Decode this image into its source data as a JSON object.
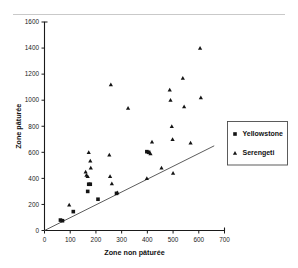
{
  "chart_data": {
    "type": "scatter",
    "title": "",
    "xlabel": "Zone non pâturée",
    "ylabel": "Zone pâturée",
    "xlim": [
      0,
      700
    ],
    "ylim": [
      0,
      1600
    ],
    "xticks": [
      0,
      100,
      200,
      300,
      400,
      500,
      600,
      700
    ],
    "yticks": [
      0,
      200,
      400,
      600,
      800,
      1000,
      1200,
      1400,
      1600
    ],
    "grid": false,
    "legend_position": "right",
    "series": [
      {
        "name": "Yellowstone",
        "marker": "square",
        "color": "#141414",
        "points": [
          [
            62,
            80
          ],
          [
            70,
            75
          ],
          [
            112,
            145
          ],
          [
            168,
            300
          ],
          [
            172,
            355
          ],
          [
            178,
            355
          ],
          [
            208,
            240
          ],
          [
            280,
            285
          ],
          [
            398,
            605
          ],
          [
            405,
            600
          ]
        ]
      },
      {
        "name": "Serengeti",
        "marker": "triangle",
        "color": "#141414",
        "points": [
          [
            96,
            197
          ],
          [
            160,
            450
          ],
          [
            163,
            425
          ],
          [
            168,
            415
          ],
          [
            172,
            600
          ],
          [
            178,
            535
          ],
          [
            180,
            480
          ],
          [
            252,
            580
          ],
          [
            255,
            415
          ],
          [
            262,
            360
          ],
          [
            258,
            1120
          ],
          [
            283,
            290
          ],
          [
            325,
            940
          ],
          [
            398,
            400
          ],
          [
            412,
            590
          ],
          [
            418,
            680
          ],
          [
            455,
            480
          ],
          [
            487,
            1080
          ],
          [
            490,
            1000
          ],
          [
            495,
            800
          ],
          [
            498,
            700
          ],
          [
            500,
            440
          ],
          [
            538,
            1170
          ],
          [
            543,
            950
          ],
          [
            568,
            672
          ],
          [
            605,
            1400
          ],
          [
            608,
            1020
          ]
        ]
      }
    ],
    "reference_line": {
      "label": "1:1 reference line",
      "from": [
        0,
        0
      ],
      "to": [
        660,
        650
      ]
    }
  },
  "legend": {
    "entries": [
      {
        "label": "Yellowstone",
        "marker": "square"
      },
      {
        "label": "Serengeti",
        "marker": "triangle"
      }
    ]
  }
}
